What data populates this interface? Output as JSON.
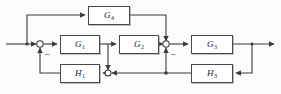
{
  "diagram": {
    "type": "block-diagram",
    "background_color": "#fdfdfd",
    "line_color": "#3a3a3a",
    "blocks": [
      {
        "id": "G4",
        "letter": "G",
        "subscript": "4",
        "label": "G4",
        "x": 88,
        "y": 6,
        "w": 42,
        "h": 19
      },
      {
        "id": "G1",
        "letter": "G",
        "subscript": "1",
        "label": "G1",
        "x": 60,
        "y": 35,
        "w": 40,
        "h": 19
      },
      {
        "id": "G2",
        "letter": "G",
        "subscript": "2",
        "label": "G2",
        "x": 119,
        "y": 35,
        "w": 40,
        "h": 19
      },
      {
        "id": "G3",
        "letter": "G",
        "subscript": "3",
        "label": "G3",
        "x": 191,
        "y": 35,
        "w": 42,
        "h": 19
      },
      {
        "id": "H1",
        "letter": "H",
        "subscript": "1",
        "label": "H1",
        "x": 60,
        "y": 64,
        "w": 40,
        "h": 19
      },
      {
        "id": "H3",
        "letter": "H",
        "subscript": "3",
        "label": "H3",
        "x": 191,
        "y": 64,
        "w": 42,
        "h": 19
      }
    ],
    "summing_junctions": [
      {
        "id": "sum-left",
        "x": 40,
        "y": 44,
        "signs": [
          "-"
        ]
      },
      {
        "id": "sum-right",
        "x": 166,
        "y": 44,
        "signs": [
          "-"
        ]
      }
    ],
    "branch_points": [
      {
        "id": "node-input-tap",
        "x": 27,
        "y": 44
      },
      {
        "id": "node-g1-out",
        "x": 108,
        "y": 44
      },
      {
        "id": "node-h1-in",
        "x": 108,
        "y": 73
      },
      {
        "id": "node-feedback",
        "x": 166,
        "y": 73
      }
    ],
    "signs": [
      {
        "id": "sign-left",
        "text": "–",
        "x": 45,
        "y": 51
      },
      {
        "id": "sign-right",
        "text": "–",
        "x": 171,
        "y": 51
      }
    ],
    "signal_lines": [
      {
        "id": "input-line",
        "from": "input",
        "to": "sum-left"
      },
      {
        "id": "g4-forward",
        "from": "node-input-tap",
        "to": "G4"
      },
      {
        "id": "g4-to-sum",
        "from": "G4",
        "to": "sum-right"
      },
      {
        "id": "sum-to-g1",
        "from": "sum-left",
        "to": "G1"
      },
      {
        "id": "g1-to-g2",
        "from": "G1",
        "to": "G2"
      },
      {
        "id": "g2-to-sum",
        "from": "G2",
        "to": "sum-right"
      },
      {
        "id": "sum-to-g3",
        "from": "sum-right",
        "to": "G3"
      },
      {
        "id": "g3-to-output",
        "from": "G3",
        "to": "output"
      },
      {
        "id": "output-to-h3",
        "from": "output-tap",
        "to": "H3"
      },
      {
        "id": "h3-to-node",
        "from": "H3",
        "to": "node-feedback"
      },
      {
        "id": "node-to-sum",
        "from": "node-feedback",
        "to": "sum-right"
      },
      {
        "id": "node-to-h1",
        "from": "node-feedback",
        "to": "H1"
      },
      {
        "id": "g1-tap-down",
        "from": "node-g1-out",
        "to": "node-h1-in"
      },
      {
        "id": "h1-to-sum",
        "from": "H1",
        "to": "sum-left"
      }
    ]
  }
}
